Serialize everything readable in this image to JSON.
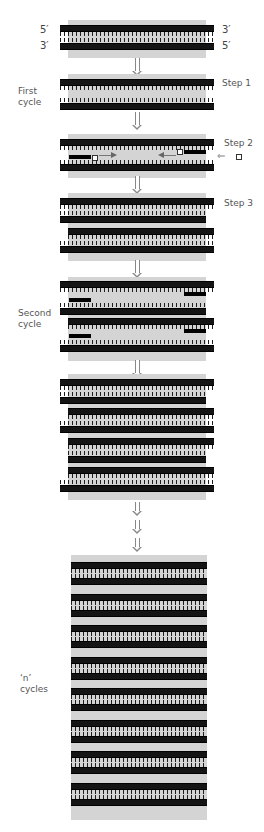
{
  "diagram": {
    "type": "PCR amplification cycle diagram",
    "end_labels": {
      "top_left": "5′",
      "top_right": "3′",
      "bottom_left": "3′",
      "bottom_right": "5′"
    },
    "cycle_labels": {
      "first": "First\ncycle",
      "second": "Second\ncycle",
      "n": "‘n’\ncycles"
    },
    "step_labels": [
      "Step 1",
      "Step 2",
      "Step 3"
    ],
    "icons": {
      "flow_arrow": "down-arrow-icon",
      "primer_marker": "square-marker-icon",
      "extension_arrow": "horizontal-arrow-icon",
      "input_arrow": "left-arrow-icon"
    },
    "colors": {
      "strand": "#141414",
      "background_band": "#d4d4d4",
      "label_text": "#555555",
      "arrow": "#888888"
    }
  }
}
